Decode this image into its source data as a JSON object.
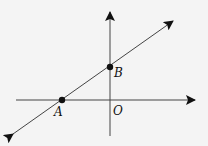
{
  "diagram": {
    "type": "coordinate-line",
    "colors": {
      "stroke": "#444444",
      "arrow": "#111111",
      "point": "#111111",
      "background": "#f4f4f4"
    },
    "axes": {
      "x_axis": {
        "from": [
          16,
          100
        ],
        "to": [
          195,
          100
        ]
      },
      "y_axis": {
        "from": [
          110,
          136
        ],
        "to": [
          110,
          12
        ]
      }
    },
    "line": {
      "from": [
        13,
        134
      ],
      "to": [
        173,
        21
      ]
    },
    "points": [
      {
        "name": "A",
        "x": 62,
        "y": 100,
        "label_x": 54,
        "label_y": 116
      },
      {
        "name": "B",
        "x": 110,
        "y": 67,
        "label_x": 114,
        "label_y": 77
      }
    ],
    "origin": {
      "label": "O",
      "label_x": 113,
      "label_y": 115
    }
  }
}
